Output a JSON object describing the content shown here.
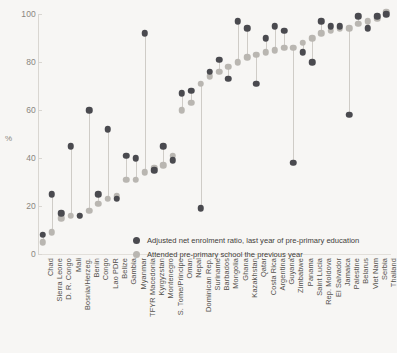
{
  "chart_data": {
    "type": "scatter",
    "title": "",
    "xlabel": "",
    "ylabel": "%",
    "ylim": [
      0,
      100
    ],
    "yticks": [
      0,
      20,
      40,
      60,
      80,
      100
    ],
    "grid": false,
    "legend_position": "inside-bottom-center",
    "categories": [
      "Chad",
      "Sierra Leone",
      "D. R. Congo",
      "Mali",
      "Bosnia/Herzeg.",
      "Benin",
      "Congo",
      "Lao PDR",
      "Belize",
      "Gambia",
      "Myanmar",
      "TFYR Macedonia",
      "Kyrgyzstan",
      "Montenegro",
      "S. Tome/Principe",
      "Oman",
      "Nepal",
      "Dominican Rep.",
      "Suriname",
      "Barbados",
      "Mongolia",
      "Ghana",
      "Kazakhstan",
      "Qatar",
      "Costa Rica",
      "Argentina",
      "Guyana",
      "Zimbabwe",
      "Panama",
      "Saint Lucia",
      "Rep. Moldova",
      "El Salvador",
      "Jamaica",
      "Palestine",
      "Belarus",
      "Viet Nam",
      "Serbia",
      "Thailand"
    ],
    "series": [
      {
        "name": "Adjusted net enrolment ratio, last year of pre-primary education",
        "color": "#4a4a4f",
        "values": [
          8,
          25,
          17,
          45,
          16,
          60,
          25,
          52,
          23,
          41,
          40,
          92,
          35,
          45,
          39,
          67,
          68,
          19,
          76,
          81,
          73,
          97,
          94,
          71,
          90,
          95,
          93,
          38,
          84,
          80,
          97,
          95,
          95,
          58,
          99,
          94,
          99,
          100
        ]
      },
      {
        "name": "Attended pre-primary school the previous year",
        "color": "#b9b6b1",
        "values": [
          5,
          9,
          15,
          16,
          16,
          18,
          21,
          23,
          24,
          31,
          31,
          34,
          36,
          37,
          41,
          60,
          63,
          71,
          74,
          76,
          78,
          80,
          82,
          83,
          84,
          85,
          86,
          86,
          88,
          90,
          92,
          93,
          94,
          94,
          96,
          97,
          98,
          101
        ]
      }
    ]
  },
  "legend": {
    "items": [
      {
        "label": "Adjusted net enrolment ratio, last year of pre-primary education",
        "swatch": "dark"
      },
      {
        "label": "Attended pre-primary school the previous year",
        "swatch": "light"
      }
    ]
  },
  "axis": {
    "y_title": "%"
  }
}
